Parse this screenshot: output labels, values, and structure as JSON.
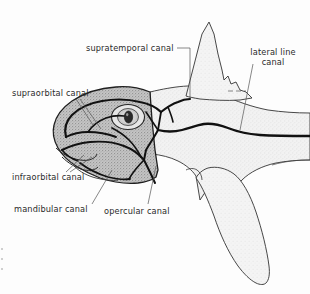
{
  "figure": {
    "view": "left lateral",
    "background_color": "#fdfdfd",
    "ink_color": "#1a1a1a",
    "head_fill": "#b8b8b8",
    "body_fill": "#e8e8e8",
    "label_color": "#2b2b2b"
  },
  "labels": {
    "supratemporal": "supratemporal canal",
    "supraorbital": "supraorbital canal",
    "lateral_line_line1": "lateral line",
    "lateral_line_line2": "canal",
    "infraorbital": "infraorbital canal",
    "mandibular": "mandibular canal",
    "opercular": "opercular canal"
  },
  "anatomy": {
    "eye": "eye",
    "dorsal_fin": "dorsal fin",
    "pectoral_fin": "pectoral fin",
    "snout": "snout",
    "operculum": "operculum",
    "head_region": "head",
    "body_region": "body"
  },
  "canals": [
    "supratemporal canal",
    "supraorbital canal",
    "lateral line canal",
    "infraorbital canal",
    "mandibular canal",
    "opercular canal"
  ]
}
